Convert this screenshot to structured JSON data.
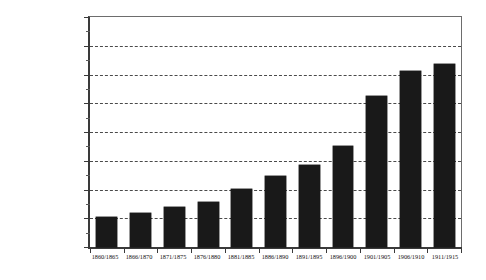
{
  "chart_data": {
    "type": "bar",
    "title": "",
    "subtitle": "",
    "xlabel": "",
    "ylabel": "",
    "categories": [
      "1860/1865",
      "1866/1870",
      "1871/1875",
      "1876/1880",
      "1881/1885",
      "1886/1890",
      "1891/1895",
      "1896/1900",
      "1901/1905",
      "1906/1910",
      "1911/1915"
    ],
    "values": [
      5200000,
      5900000,
      6900000,
      7900000,
      10100000,
      12400000,
      14200000,
      17600000,
      26300000,
      30600000,
      31900000
    ],
    "ylim": [
      0,
      40000000
    ],
    "ytick_values": [
      0,
      5000000,
      10000000,
      15000000,
      20000000,
      25000000,
      30000000,
      35000000,
      40000000
    ],
    "ytick_labels": [
      "0",
      "5.000.000",
      "10.000.000",
      "15.000.000",
      "20.000.000",
      "25.000.000",
      "30.000.000",
      "35.000.000",
      "40.000.000"
    ],
    "grid": true,
    "grid_style": "dashed",
    "grid_axis": "y",
    "legend": false,
    "legend_position": "none",
    "bar_color": "#191919",
    "grid_color": "#4a4a4a",
    "axis_color": "#3a3a3a",
    "background_color": "#ffffff"
  }
}
